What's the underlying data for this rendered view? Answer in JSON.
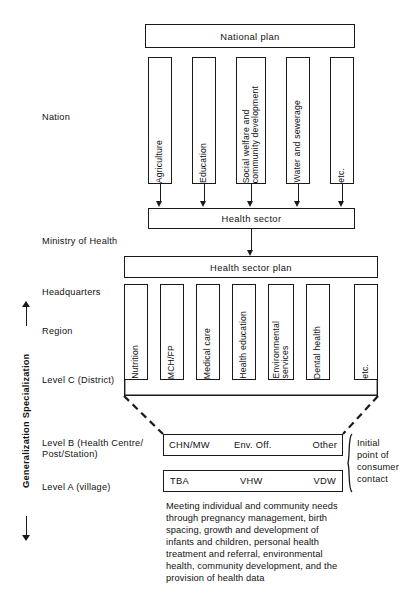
{
  "diagram": {
    "axis": {
      "label": "Generalization        Specialization",
      "top_arrow": "arrow-up",
      "bottom_arrow": "arrow-down"
    },
    "stage_labels": [
      {
        "id": "nation",
        "text": "Nation"
      },
      {
        "id": "ministry",
        "text": "Ministry of Health"
      },
      {
        "id": "hq",
        "text": "Headquarters"
      },
      {
        "id": "region",
        "text": "Region"
      },
      {
        "id": "levelc",
        "text": "Level C (District)"
      },
      {
        "id": "levelb",
        "text": "Level B (Health Centre/\nPost/Station)"
      },
      {
        "id": "levela",
        "text": "Level A (village)"
      }
    ],
    "national_plan": {
      "label": "National plan"
    },
    "sectors": [
      {
        "id": "agriculture",
        "label": "Agriculture"
      },
      {
        "id": "education",
        "label": "Education"
      },
      {
        "id": "social-welfare",
        "label": "Social welfare and\ncommunity development"
      },
      {
        "id": "water-sewerage",
        "label": "Water and sewerage"
      },
      {
        "id": "etc-nation",
        "label": "etc."
      }
    ],
    "health_sector": {
      "label": "Health sector"
    },
    "health_sector_plan": {
      "label": "Health sector plan"
    },
    "services": [
      {
        "id": "nutrition",
        "label": "Nutrition"
      },
      {
        "id": "mch-fp",
        "label": "MCH/FP"
      },
      {
        "id": "medical-care",
        "label": "Medical care"
      },
      {
        "id": "health-education",
        "label": "Health education"
      },
      {
        "id": "environmental-services",
        "label": "Environmental\nservices"
      },
      {
        "id": "dental-health",
        "label": "Dental health"
      },
      {
        "id": "etc-service",
        "label": "etc."
      }
    ],
    "level_b_row": {
      "id": "level-b",
      "cells": [
        {
          "id": "chn-mw",
          "label": "CHN/MW"
        },
        {
          "id": "env-off",
          "label": "Env. Off."
        },
        {
          "id": "other",
          "label": "Other"
        }
      ]
    },
    "level_a_row": {
      "id": "level-a",
      "cells": [
        {
          "id": "tba",
          "label": "TBA"
        },
        {
          "id": "vhw",
          "label": "VHW"
        },
        {
          "id": "vdw",
          "label": "VDW"
        }
      ]
    },
    "bracket_note": {
      "text": "Initial\npoint of\nconsumer\ncontact"
    },
    "footer_paragraph": {
      "text": "Meeting individual and community needs\nthrough pregnancy management, birth\nspacing, growth and development of\ninfants and children, personal health\ntreatment and referral, environmental\nhealth, community development, and the\nprovision of health data"
    },
    "colors": {
      "stroke": "#1a1a1a",
      "background": "#ffffff",
      "text": "#111111"
    }
  }
}
